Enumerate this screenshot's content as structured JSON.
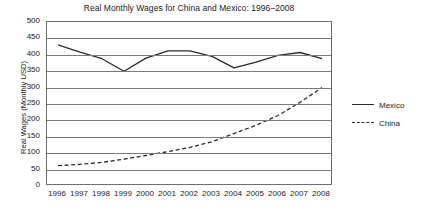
{
  "chart_data": {
    "type": "line",
    "title": "Real Monthly Wages for China and Mexico: 1996–2008",
    "xlabel": "",
    "ylabel": "Real Wages (Monthly USD)",
    "x": [
      1996,
      1997,
      1998,
      1999,
      2000,
      2001,
      2002,
      2003,
      2004,
      2005,
      2006,
      2007,
      2008
    ],
    "xtick_labels": [
      "1996",
      "1997",
      "1998",
      "1999",
      "2000",
      "2001",
      "2002",
      "2003",
      "2004",
      "2005",
      "2006",
      "2007",
      "2008"
    ],
    "ytick_labels": [
      "500",
      "450",
      "400",
      "350",
      "300",
      "250",
      "200",
      "150",
      "100",
      "50",
      "0"
    ],
    "yticks": [
      500,
      450,
      400,
      350,
      300,
      250,
      200,
      150,
      100,
      50,
      0
    ],
    "ylim": [
      0,
      500
    ],
    "grid": "horizontal",
    "legend_position": "right",
    "series": [
      {
        "name": "Mexico",
        "style": "solid",
        "color": "#2b2b2b",
        "values": [
          430,
          408,
          388,
          350,
          390,
          412,
          412,
          395,
          360,
          378,
          398,
          407,
          388
        ]
      },
      {
        "name": "China",
        "style": "dashed",
        "color": "#2b2b2b",
        "values": [
          62,
          66,
          72,
          82,
          93,
          105,
          118,
          135,
          160,
          185,
          215,
          255,
          300
        ]
      }
    ]
  },
  "legend": {
    "items": [
      {
        "label": "Mexico"
      },
      {
        "label": "China"
      }
    ]
  }
}
